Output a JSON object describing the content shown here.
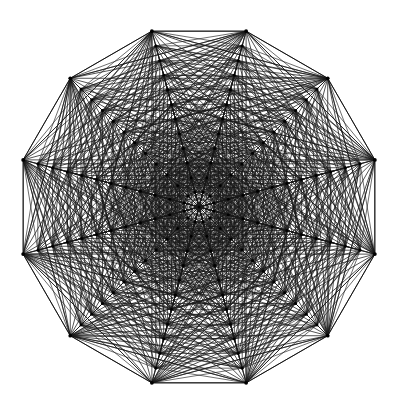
{
  "figure": {
    "title": "Complete geometric graph on a 12-fold concentric ring lattice",
    "kind": "geometric-graph-diagram",
    "background_color": "#ffffff",
    "line_color": "#141414",
    "node_color": "#000000",
    "canvas": {
      "width": 397,
      "height": 406
    }
  },
  "chart_data": {
    "type": "diagram",
    "title": "Complete geometric graph on a 12-fold concentric ring lattice",
    "subtitle": "",
    "xlabel": "",
    "ylabel": "",
    "grid": false,
    "legend": false,
    "legend_position": "none",
    "xlim": [
      0,
      397
    ],
    "ylim": [
      0,
      406
    ],
    "geometry": {
      "center_x": 199,
      "center_y": 207,
      "outer_radius": 182,
      "symmetry_order": 12,
      "ring_count": 12,
      "ring_radius_step": 15.17,
      "ring_angle_offset_deg": -75,
      "ring_radii": [
        0,
        15.2,
        30.3,
        45.5,
        60.7,
        75.8,
        91.0,
        106.2,
        121.3,
        136.5,
        151.7,
        166.8,
        182.0
      ],
      "vertices_per_ring": 12,
      "center_vertex": true,
      "total_vertices": 145,
      "node_radius_outer_px": 1.9,
      "node_radius_inner_px": 1.5
    },
    "edges": {
      "rule": "chords connecting ring vertices at matching and offset angular indices",
      "hull_edges": 12,
      "spoke_count_at_center": 24,
      "connect_ring_neighbors": true,
      "connect_radial_spokes": true,
      "connect_cross_chords": true,
      "horizontal_chords_visible": true
    },
    "outer_polygon_vertices": [
      {
        "index": 0,
        "x": 160,
        "y": 22
      },
      {
        "index": 1,
        "x": 240,
        "y": 22
      },
      {
        "index": 2,
        "x": 313,
        "y": 59
      },
      {
        "index": 3,
        "x": 363,
        "y": 123
      },
      {
        "index": 4,
        "x": 381,
        "y": 207
      },
      {
        "index": 5,
        "x": 363,
        "y": 291
      },
      {
        "index": 6,
        "x": 313,
        "y": 355
      },
      {
        "index": 7,
        "x": 240,
        "y": 386
      },
      {
        "index": 8,
        "x": 160,
        "y": 386
      },
      {
        "index": 9,
        "x": 87,
        "y": 355
      },
      {
        "index": 10,
        "x": 37,
        "y": 291
      },
      {
        "index": 11,
        "x": 17,
        "y": 207
      },
      {
        "index": 12,
        "x": 37,
        "y": 123
      },
      {
        "index": 13,
        "x": 87,
        "y": 59
      }
    ],
    "annotations": []
  }
}
